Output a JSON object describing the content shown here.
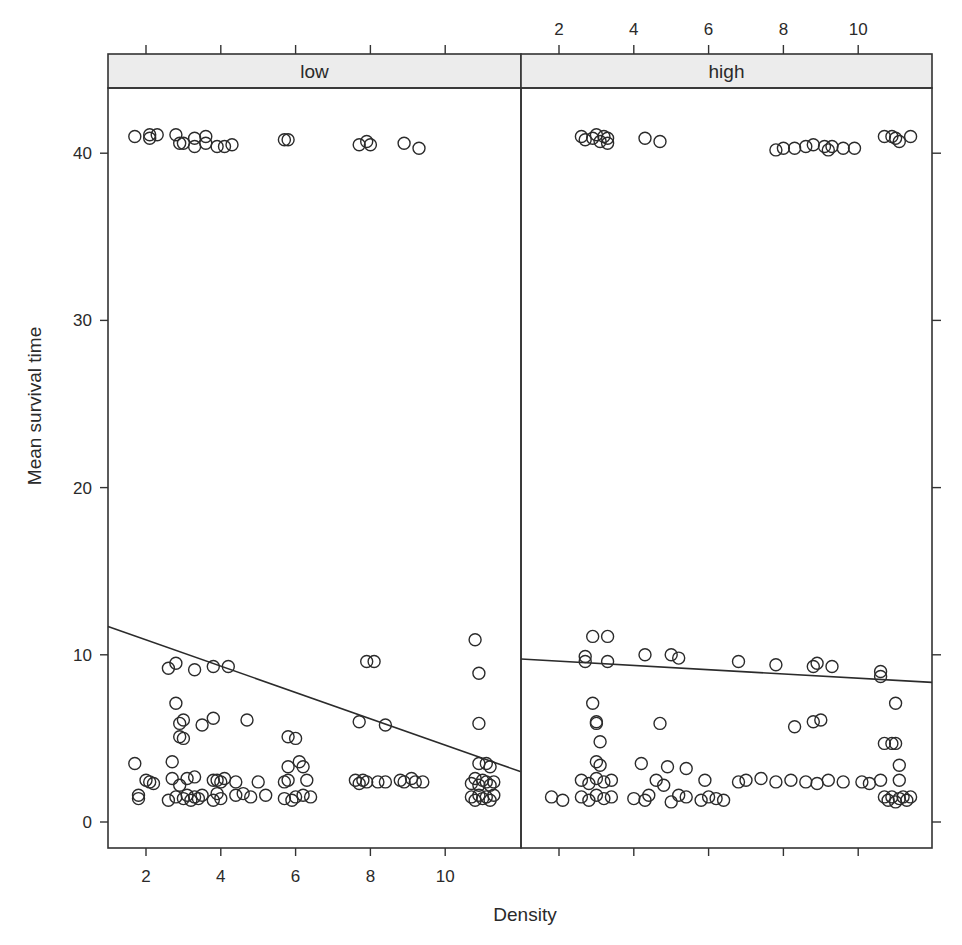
{
  "chart_data": {
    "type": "scatter",
    "title": "",
    "xlabel": "Density",
    "ylabel": "Mean survival time",
    "xlim": [
      1.0,
      12.03
    ],
    "ylim": [
      -1.6,
      43.9
    ],
    "x_ticks": [
      2,
      4,
      6,
      8,
      10
    ],
    "y_ticks": [
      0,
      10,
      20,
      30,
      40
    ],
    "grid": false,
    "legend": null,
    "layout": "lattice 2 panels side by side, strip labels on top; x tick labels alternate bottom (left panel) and top (right panel); y tick labels on left only",
    "panels": [
      {
        "name": "low",
        "fit_line": {
          "x": [
            1.0,
            12.03
          ],
          "y": [
            11.7,
            3.0
          ]
        },
        "points": [
          [
            1.7,
            41.0
          ],
          [
            2.1,
            40.9
          ],
          [
            2.1,
            41.1
          ],
          [
            2.3,
            41.1
          ],
          [
            2.8,
            41.1
          ],
          [
            2.9,
            40.6
          ],
          [
            3.0,
            40.6
          ],
          [
            3.3,
            40.9
          ],
          [
            3.3,
            40.4
          ],
          [
            3.6,
            41.0
          ],
          [
            3.6,
            40.6
          ],
          [
            3.9,
            40.4
          ],
          [
            4.1,
            40.4
          ],
          [
            4.3,
            40.5
          ],
          [
            5.7,
            40.8
          ],
          [
            5.8,
            40.8
          ],
          [
            7.7,
            40.5
          ],
          [
            7.9,
            40.7
          ],
          [
            8.0,
            40.5
          ],
          [
            8.9,
            40.6
          ],
          [
            9.3,
            40.3
          ],
          [
            2.6,
            9.2
          ],
          [
            2.8,
            9.5
          ],
          [
            3.3,
            9.1
          ],
          [
            3.8,
            9.3
          ],
          [
            4.2,
            9.3
          ],
          [
            7.9,
            9.6
          ],
          [
            8.1,
            9.6
          ],
          [
            10.8,
            10.9
          ],
          [
            10.9,
            8.9
          ],
          [
            10.9,
            5.9
          ],
          [
            2.8,
            7.1
          ],
          [
            2.9,
            5.9
          ],
          [
            3.0,
            6.1
          ],
          [
            3.5,
            5.8
          ],
          [
            3.8,
            6.2
          ],
          [
            4.7,
            6.1
          ],
          [
            2.9,
            5.1
          ],
          [
            3.0,
            5.0
          ],
          [
            5.8,
            5.1
          ],
          [
            6.0,
            5.0
          ],
          [
            7.7,
            6.0
          ],
          [
            8.4,
            5.8
          ],
          [
            1.7,
            3.5
          ],
          [
            2.7,
            3.6
          ],
          [
            5.8,
            3.3
          ],
          [
            6.1,
            3.6
          ],
          [
            6.2,
            3.3
          ],
          [
            10.9,
            3.5
          ],
          [
            11.1,
            3.5
          ],
          [
            11.2,
            3.3
          ],
          [
            1.8,
            1.6
          ],
          [
            1.8,
            1.4
          ],
          [
            2.0,
            2.5
          ],
          [
            2.1,
            2.4
          ],
          [
            2.2,
            2.3
          ],
          [
            2.7,
            2.6
          ],
          [
            2.9,
            2.2
          ],
          [
            3.1,
            2.6
          ],
          [
            3.3,
            2.7
          ],
          [
            3.8,
            2.5
          ],
          [
            3.9,
            2.5
          ],
          [
            4.0,
            2.4
          ],
          [
            4.1,
            2.6
          ],
          [
            4.4,
            2.4
          ],
          [
            5.0,
            2.4
          ],
          [
            5.7,
            2.4
          ],
          [
            5.8,
            2.5
          ],
          [
            6.3,
            2.5
          ],
          [
            2.6,
            1.3
          ],
          [
            2.8,
            1.5
          ],
          [
            3.0,
            1.4
          ],
          [
            3.1,
            1.6
          ],
          [
            3.2,
            1.3
          ],
          [
            3.3,
            1.5
          ],
          [
            3.4,
            1.4
          ],
          [
            3.5,
            1.6
          ],
          [
            3.8,
            1.3
          ],
          [
            3.9,
            1.7
          ],
          [
            4.0,
            1.4
          ],
          [
            4.4,
            1.6
          ],
          [
            4.6,
            1.7
          ],
          [
            4.8,
            1.5
          ],
          [
            5.2,
            1.6
          ],
          [
            5.7,
            1.4
          ],
          [
            5.9,
            1.3
          ],
          [
            6.0,
            1.5
          ],
          [
            6.2,
            1.6
          ],
          [
            6.4,
            1.5
          ],
          [
            7.6,
            2.5
          ],
          [
            7.7,
            2.3
          ],
          [
            7.8,
            2.5
          ],
          [
            7.9,
            2.4
          ],
          [
            8.2,
            2.4
          ],
          [
            8.4,
            2.4
          ],
          [
            8.8,
            2.5
          ],
          [
            8.9,
            2.4
          ],
          [
            9.1,
            2.6
          ],
          [
            9.2,
            2.4
          ],
          [
            9.4,
            2.4
          ],
          [
            10.7,
            2.3
          ],
          [
            10.8,
            2.6
          ],
          [
            10.9,
            2.2
          ],
          [
            11.0,
            2.5
          ],
          [
            11.1,
            2.4
          ],
          [
            11.2,
            2.2
          ],
          [
            11.3,
            2.4
          ],
          [
            10.7,
            1.5
          ],
          [
            10.8,
            1.3
          ],
          [
            10.9,
            1.6
          ],
          [
            11.0,
            1.4
          ],
          [
            11.1,
            1.5
          ],
          [
            11.2,
            1.3
          ],
          [
            11.3,
            1.6
          ]
        ]
      },
      {
        "name": "high",
        "fit_line": {
          "x": [
            1.0,
            12.03
          ],
          "y": [
            9.75,
            8.35
          ]
        },
        "points": [
          [
            2.6,
            41.0
          ],
          [
            2.7,
            40.8
          ],
          [
            2.9,
            40.9
          ],
          [
            3.0,
            41.1
          ],
          [
            3.1,
            40.7
          ],
          [
            3.2,
            41.0
          ],
          [
            3.3,
            40.9
          ],
          [
            3.3,
            40.6
          ],
          [
            4.3,
            40.9
          ],
          [
            4.7,
            40.7
          ],
          [
            7.8,
            40.2
          ],
          [
            8.0,
            40.3
          ],
          [
            8.3,
            40.3
          ],
          [
            8.6,
            40.4
          ],
          [
            8.8,
            40.5
          ],
          [
            9.1,
            40.4
          ],
          [
            9.2,
            40.2
          ],
          [
            9.3,
            40.4
          ],
          [
            9.6,
            40.3
          ],
          [
            9.9,
            40.3
          ],
          [
            10.7,
            41.0
          ],
          [
            10.9,
            41.0
          ],
          [
            11.0,
            40.9
          ],
          [
            11.1,
            40.7
          ],
          [
            11.4,
            41.0
          ],
          [
            2.9,
            11.1
          ],
          [
            3.3,
            11.1
          ],
          [
            2.7,
            9.9
          ],
          [
            2.7,
            9.6
          ],
          [
            3.3,
            9.6
          ],
          [
            4.3,
            10.0
          ],
          [
            5.0,
            10.0
          ],
          [
            5.2,
            9.8
          ],
          [
            6.8,
            9.6
          ],
          [
            7.8,
            9.4
          ],
          [
            8.8,
            9.3
          ],
          [
            8.9,
            9.5
          ],
          [
            9.3,
            9.3
          ],
          [
            10.6,
            9.0
          ],
          [
            10.6,
            8.7
          ],
          [
            2.9,
            7.1
          ],
          [
            3.0,
            5.9
          ],
          [
            3.0,
            6.0
          ],
          [
            3.1,
            4.8
          ],
          [
            4.7,
            5.9
          ],
          [
            8.3,
            5.7
          ],
          [
            8.8,
            6.0
          ],
          [
            9.0,
            6.1
          ],
          [
            11.0,
            7.1
          ],
          [
            10.7,
            4.7
          ],
          [
            10.9,
            4.7
          ],
          [
            11.0,
            4.7
          ],
          [
            3.0,
            3.6
          ],
          [
            3.1,
            3.4
          ],
          [
            4.2,
            3.5
          ],
          [
            4.9,
            3.3
          ],
          [
            5.4,
            3.2
          ],
          [
            5.9,
            2.5
          ],
          [
            11.1,
            3.4
          ],
          [
            11.1,
            2.5
          ],
          [
            1.8,
            1.5
          ],
          [
            2.1,
            1.3
          ],
          [
            2.6,
            2.5
          ],
          [
            2.8,
            2.3
          ],
          [
            3.0,
            2.6
          ],
          [
            3.2,
            2.4
          ],
          [
            3.4,
            2.5
          ],
          [
            2.6,
            1.5
          ],
          [
            2.8,
            1.3
          ],
          [
            3.0,
            1.6
          ],
          [
            3.2,
            1.4
          ],
          [
            3.4,
            1.5
          ],
          [
            4.0,
            1.4
          ],
          [
            4.3,
            1.3
          ],
          [
            4.4,
            1.6
          ],
          [
            4.6,
            2.5
          ],
          [
            4.8,
            2.2
          ],
          [
            5.0,
            1.2
          ],
          [
            5.2,
            1.6
          ],
          [
            5.4,
            1.5
          ],
          [
            5.8,
            1.3
          ],
          [
            6.0,
            1.5
          ],
          [
            6.2,
            1.4
          ],
          [
            6.4,
            1.3
          ],
          [
            6.8,
            2.4
          ],
          [
            7.0,
            2.5
          ],
          [
            7.4,
            2.6
          ],
          [
            7.8,
            2.4
          ],
          [
            8.2,
            2.5
          ],
          [
            8.6,
            2.4
          ],
          [
            8.9,
            2.3
          ],
          [
            9.2,
            2.5
          ],
          [
            9.6,
            2.4
          ],
          [
            10.1,
            2.4
          ],
          [
            10.3,
            2.3
          ],
          [
            10.6,
            2.5
          ],
          [
            10.7,
            1.5
          ],
          [
            10.8,
            1.3
          ],
          [
            10.9,
            1.5
          ],
          [
            11.0,
            1.2
          ],
          [
            11.1,
            1.4
          ],
          [
            11.2,
            1.5
          ],
          [
            11.3,
            1.3
          ],
          [
            11.4,
            1.5
          ]
        ]
      }
    ]
  },
  "labels": {
    "xlabel": "Density",
    "ylabel": "Mean survival time",
    "panel_low": "low",
    "panel_high": "high"
  }
}
